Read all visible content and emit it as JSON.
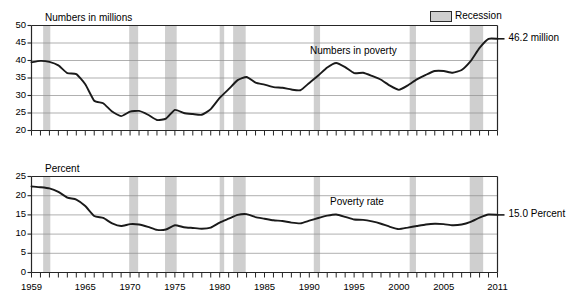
{
  "figure": {
    "legend": {
      "label": "Recession",
      "swatch_color": "#cfcfcf"
    },
    "panels": [
      {
        "id": "numbers",
        "unit_title": "Numbers in millions",
        "series_label": "Numbers in poverty",
        "end_annotation": "46.2 million"
      },
      {
        "id": "percent",
        "unit_title": "Percent",
        "series_label": "Poverty rate",
        "end_annotation": "15.0 Percent"
      }
    ],
    "xaxis": {
      "tick_labels": [
        "1959",
        "1965",
        "1970",
        "1975",
        "1980",
        "1985",
        "1990",
        "1995",
        "2000",
        "2005",
        "2011"
      ],
      "range": [
        1959,
        2011
      ]
    }
  },
  "chart_data": [
    {
      "type": "line",
      "id": "numbers-in-poverty",
      "title": "Numbers in poverty",
      "xlabel": "",
      "ylabel": "Numbers in millions",
      "ylim": [
        20,
        50
      ],
      "ytick_labels": [
        "20",
        "25",
        "30",
        "35",
        "40",
        "45",
        "50"
      ],
      "yticks": [
        20,
        25,
        30,
        35,
        40,
        45,
        50
      ],
      "xlim": [
        1959,
        2011
      ],
      "grid": true,
      "line_color": "#1a1a1a",
      "x": [
        1959,
        1960,
        1961,
        1962,
        1963,
        1964,
        1965,
        1966,
        1967,
        1968,
        1969,
        1970,
        1971,
        1972,
        1973,
        1974,
        1975,
        1976,
        1977,
        1978,
        1979,
        1980,
        1981,
        1982,
        1983,
        1984,
        1985,
        1986,
        1987,
        1988,
        1989,
        1990,
        1991,
        1992,
        1993,
        1994,
        1995,
        1996,
        1997,
        1998,
        1999,
        2000,
        2001,
        2002,
        2003,
        2004,
        2005,
        2006,
        2007,
        2008,
        2009,
        2010,
        2011
      ],
      "values": [
        39.5,
        39.9,
        39.6,
        38.6,
        36.4,
        36.1,
        33.2,
        28.5,
        27.8,
        25.4,
        24.1,
        25.4,
        25.6,
        24.5,
        23.0,
        23.4,
        25.9,
        25.0,
        24.7,
        24.5,
        26.1,
        29.3,
        31.8,
        34.4,
        35.3,
        33.7,
        33.1,
        32.4,
        32.2,
        31.7,
        31.5,
        33.6,
        35.7,
        38.0,
        39.3,
        38.1,
        36.4,
        36.5,
        35.6,
        34.5,
        32.8,
        31.6,
        32.9,
        34.6,
        35.9,
        37.0,
        37.0,
        36.5,
        37.3,
        39.8,
        43.6,
        46.2,
        46.2
      ],
      "end_value": 46.2,
      "end_label": "46.2 million"
    },
    {
      "type": "line",
      "id": "poverty-rate",
      "title": "Poverty rate",
      "xlabel": "",
      "ylabel": "Percent",
      "ylim": [
        0,
        25
      ],
      "ytick_labels": [
        "0",
        "5",
        "10",
        "15",
        "20",
        "25"
      ],
      "yticks": [
        0,
        5,
        10,
        15,
        20,
        25
      ],
      "xlim": [
        1959,
        2011
      ],
      "grid": true,
      "line_color": "#1a1a1a",
      "x": [
        1959,
        1960,
        1961,
        1962,
        1963,
        1964,
        1965,
        1966,
        1967,
        1968,
        1969,
        1970,
        1971,
        1972,
        1973,
        1974,
        1975,
        1976,
        1977,
        1978,
        1979,
        1980,
        1981,
        1982,
        1983,
        1984,
        1985,
        1986,
        1987,
        1988,
        1989,
        1990,
        1991,
        1992,
        1993,
        1994,
        1995,
        1996,
        1997,
        1998,
        1999,
        2000,
        2001,
        2002,
        2003,
        2004,
        2005,
        2006,
        2007,
        2008,
        2009,
        2010,
        2011
      ],
      "values": [
        22.4,
        22.2,
        21.9,
        21.0,
        19.5,
        19.0,
        17.3,
        14.7,
        14.2,
        12.8,
        12.1,
        12.6,
        12.5,
        11.9,
        11.1,
        11.2,
        12.3,
        11.8,
        11.6,
        11.4,
        11.7,
        13.0,
        14.0,
        15.0,
        15.2,
        14.4,
        14.0,
        13.6,
        13.4,
        13.0,
        12.8,
        13.5,
        14.2,
        14.8,
        15.1,
        14.5,
        13.8,
        13.7,
        13.3,
        12.7,
        11.9,
        11.3,
        11.7,
        12.1,
        12.5,
        12.7,
        12.6,
        12.3,
        12.5,
        13.2,
        14.3,
        15.1,
        15.0
      ],
      "end_value": 15.0,
      "end_label": "15.0 Percent"
    }
  ],
  "recessions": [
    {
      "start": 1960.3,
      "end": 1961.1
    },
    {
      "start": 1969.9,
      "end": 1970.9
    },
    {
      "start": 1973.9,
      "end": 1975.2
    },
    {
      "start": 1980.0,
      "end": 1980.5
    },
    {
      "start": 1981.5,
      "end": 1982.9
    },
    {
      "start": 1990.5,
      "end": 1991.2
    },
    {
      "start": 2001.2,
      "end": 2001.9
    },
    {
      "start": 2007.9,
      "end": 2009.4
    }
  ]
}
